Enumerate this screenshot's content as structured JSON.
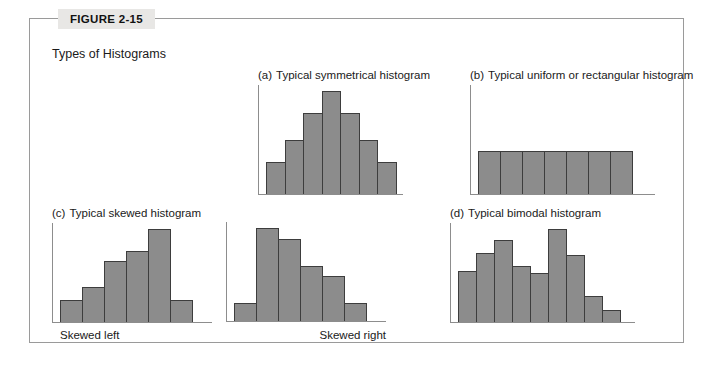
{
  "figure": {
    "number_label": "FIGURE 2-15",
    "caption": "Types of Histograms",
    "border_color": "#9a9a9a",
    "tab_background": "#e8e7e5"
  },
  "style": {
    "bar_fill": "#8c8c8c",
    "bar_border": "#3d3d3d",
    "axis_color": "#8d8d8d"
  },
  "panels": [
    {
      "enum": "(a)",
      "title": "Typical symmetrical histogram",
      "sub_label": ""
    },
    {
      "enum": "(b)",
      "title": "Typical uniform or rectangular histogram",
      "sub_label": ""
    },
    {
      "enum": "(c)",
      "title": "Typical skewed histogram",
      "sub_label": "Skewed left"
    },
    {
      "enum": "",
      "title": "",
      "sub_label": "Skewed right"
    },
    {
      "enum": "(d)",
      "title": "Typical bimodal histogram",
      "sub_label": ""
    }
  ],
  "chart_data": [
    {
      "type": "bar",
      "id": "symmetrical",
      "title": "(a) Typical symmetrical histogram",
      "categories": [
        "1",
        "2",
        "3",
        "4",
        "5",
        "6",
        "7"
      ],
      "values": [
        30,
        50,
        75,
        95,
        75,
        50,
        30
      ],
      "ylim": [
        0,
        100
      ],
      "xlabel": "",
      "ylabel": "",
      "grid": false,
      "legend": "none",
      "bar_width_px": 19.5
    },
    {
      "type": "bar",
      "id": "uniform",
      "title": "(b) Typical uniform or rectangular histogram",
      "categories": [
        "1",
        "2",
        "3",
        "4",
        "5",
        "6",
        "7"
      ],
      "values": [
        40,
        40,
        40,
        40,
        40,
        40,
        40
      ],
      "ylim": [
        0,
        100
      ],
      "xlabel": "",
      "ylabel": "",
      "grid": false,
      "legend": "none",
      "bar_width_px": 23
    },
    {
      "type": "bar",
      "id": "skewed-left",
      "title": "(c) Typical skewed histogram",
      "categories": [
        "1",
        "2",
        "3",
        "4",
        "5",
        "6"
      ],
      "values": [
        22,
        36,
        62,
        72,
        95,
        22
      ],
      "ylim": [
        0,
        100
      ],
      "xlabel": "Skewed left",
      "ylabel": "",
      "grid": false,
      "legend": "none",
      "bar_width_px": 23
    },
    {
      "type": "bar",
      "id": "skewed-right",
      "title": "Skewed right",
      "categories": [
        "1",
        "2",
        "3",
        "4",
        "5",
        "6"
      ],
      "values": [
        18,
        95,
        84,
        56,
        46,
        18
      ],
      "ylim": [
        0,
        100
      ],
      "xlabel": "Skewed right",
      "ylabel": "",
      "grid": false,
      "legend": "none",
      "bar_width_px": 23
    },
    {
      "type": "bar",
      "id": "bimodal",
      "title": "(d) Typical bimodal histogram",
      "categories": [
        "1",
        "2",
        "3",
        "4",
        "5",
        "6",
        "7",
        "8",
        "9"
      ],
      "values": [
        52,
        70,
        84,
        57,
        50,
        95,
        68,
        27,
        12
      ],
      "ylim": [
        0,
        100
      ],
      "xlabel": "",
      "ylabel": "",
      "grid": false,
      "legend": "none",
      "bar_width_px": 19
    }
  ]
}
